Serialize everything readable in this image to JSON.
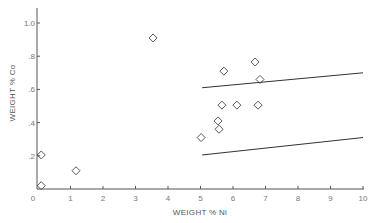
{
  "chart_data": {
    "type": "scatter",
    "title": "",
    "xlabel": "WEIGHT % Ni",
    "ylabel": "WEIGHT % Co",
    "xlim": [
      0,
      10
    ],
    "ylim": [
      0,
      1.0
    ],
    "x_ticks": [
      "0",
      "1",
      "2",
      "3",
      "4",
      "5",
      "6",
      "7",
      "8",
      "9",
      "10"
    ],
    "y_ticks": [
      ".2",
      ".4",
      ".6",
      ".8",
      "1.0"
    ],
    "grid": false,
    "legend": null,
    "marker": "open-diamond",
    "series": [
      {
        "name": "samples",
        "points": [
          {
            "x": 0.1,
            "y": 0.205
          },
          {
            "x": 0.1,
            "y": 0.02
          },
          {
            "x": 1.17,
            "y": 0.11
          },
          {
            "x": 3.54,
            "y": 0.91
          },
          {
            "x": 5.02,
            "y": 0.31
          },
          {
            "x": 5.54,
            "y": 0.41
          },
          {
            "x": 5.57,
            "y": 0.36
          },
          {
            "x": 5.66,
            "y": 0.505
          },
          {
            "x": 5.72,
            "y": 0.71
          },
          {
            "x": 6.12,
            "y": 0.505
          },
          {
            "x": 6.68,
            "y": 0.765
          },
          {
            "x": 6.77,
            "y": 0.505
          },
          {
            "x": 6.83,
            "y": 0.66
          }
        ]
      }
    ],
    "lines": [
      {
        "name": "upper-bound",
        "x": [
          5.05,
          10.0
        ],
        "y": [
          0.61,
          0.7
        ]
      },
      {
        "name": "lower-bound",
        "x": [
          5.05,
          10.0
        ],
        "y": [
          0.205,
          0.31
        ]
      }
    ]
  },
  "layout": {
    "x0_px": 38,
    "x_px_per_unit": 32.5,
    "y0_px": 189,
    "y_px_per_unit": 166
  }
}
